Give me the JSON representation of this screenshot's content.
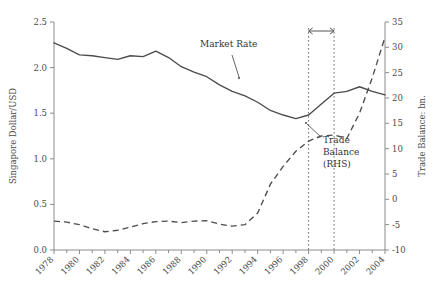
{
  "chart_data": {
    "type": "line",
    "title": "",
    "xlabel": "",
    "ylabel": "Singapore Dollar/USD",
    "y2label": "Trade Balance: bn.",
    "xlim": [
      1978,
      2004
    ],
    "ylim": [
      0.0,
      2.5
    ],
    "y2lim": [
      -10,
      35
    ],
    "grid": false,
    "legend_position": "inline-annotations",
    "y_ticks": [
      "0.0",
      "0.5",
      "1.0",
      "1.5",
      "2.0",
      "2.5"
    ],
    "y_tick_values": [
      0.0,
      0.5,
      1.0,
      1.5,
      2.0,
      2.5
    ],
    "y2_ticks": [
      "-10",
      "-5",
      "0",
      "5",
      "10",
      "15",
      "20",
      "25",
      "30",
      "35"
    ],
    "y2_tick_values": [
      -10,
      -5,
      0,
      5,
      10,
      15,
      20,
      25,
      30,
      35
    ],
    "x_ticks": [
      "1978",
      "1980",
      "1982",
      "1984",
      "1986",
      "1988",
      "1990",
      "1992",
      "1994",
      "1996",
      "1998",
      "2000",
      "2002",
      "2004"
    ],
    "x_tick_values": [
      1978,
      1980,
      1982,
      1984,
      1986,
      1988,
      1990,
      1992,
      1994,
      1996,
      1998,
      2000,
      2002,
      2004
    ],
    "x_minor_values": [
      1979,
      1981,
      1983,
      1985,
      1987,
      1989,
      1991,
      1993,
      1995,
      1997,
      1999,
      2001,
      2003
    ],
    "x": [
      1978,
      1979,
      1980,
      1981,
      1982,
      1983,
      1984,
      1985,
      1986,
      1987,
      1988,
      1989,
      1990,
      1991,
      1992,
      1993,
      1994,
      1995,
      1996,
      1997,
      1998,
      1999,
      2000,
      2001,
      2002,
      2003,
      2004
    ],
    "series": [
      {
        "name": "Market Rate",
        "axis": "left",
        "style": "solid",
        "unit": "Singapore Dollar/USD",
        "values": [
          2.27,
          2.21,
          2.14,
          2.13,
          2.11,
          2.09,
          2.13,
          2.12,
          2.18,
          2.11,
          2.01,
          1.95,
          1.9,
          1.81,
          1.74,
          1.69,
          1.62,
          1.53,
          1.48,
          1.44,
          1.48,
          1.6,
          1.72,
          1.74,
          1.79,
          1.74,
          1.7
        ]
      },
      {
        "name": "Trade Balance (RHS)",
        "axis": "right",
        "style": "dashed",
        "unit": "bn.",
        "values": [
          -4.3,
          -4.5,
          -5.0,
          -5.8,
          -6.4,
          -6.1,
          -5.5,
          -4.8,
          -4.4,
          -4.3,
          -4.6,
          -4.3,
          -4.2,
          -4.9,
          -5.3,
          -5.0,
          -2.7,
          3.0,
          6.5,
          9.5,
          11.5,
          12.5,
          12.7,
          12.0,
          17.0,
          24.0,
          32.0
        ]
      }
    ],
    "annotations": [
      {
        "id": "market-rate-label",
        "text": "Market Rate",
        "lines": [
          "Market Rate"
        ]
      },
      {
        "id": "trade-balance-label",
        "text": "Trade Balance (RHS)",
        "lines": [
          "Trade",
          "Balance",
          "(RHS)"
        ]
      }
    ],
    "reference_lines": [
      {
        "id": "vline-1998",
        "x": 1998,
        "style": "dotted"
      },
      {
        "id": "vline-2000",
        "x": 2000,
        "style": "dotted"
      }
    ],
    "span_marker": {
      "id": "crisis-span-arrow",
      "from": 1998,
      "to": 2000,
      "style": "double-arrow"
    }
  }
}
